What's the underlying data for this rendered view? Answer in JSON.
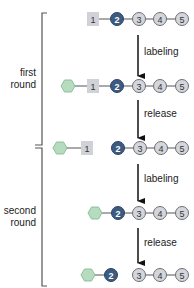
{
  "colors": {
    "dark_node": "#3d5a80",
    "light_node": "#d4d6dc",
    "node_border": "#6b6f78",
    "square": "#d0d2d8",
    "hexagon": "#b5dcbe",
    "hexagon_border": "#8fbf99",
    "line": "#555555",
    "arrow": "#111111"
  },
  "rounds": [
    {
      "label_line1": "first",
      "label_line2": "round"
    },
    {
      "label_line1": "second",
      "label_line2": "round"
    }
  ],
  "steps": [
    {
      "label": "labeling"
    },
    {
      "label": "release"
    },
    {
      "label": "labeling"
    },
    {
      "label": "release"
    }
  ],
  "rows": [
    {
      "hexagon": false,
      "square": "1",
      "circles": [
        "2",
        "3",
        "4",
        "5"
      ]
    },
    {
      "hexagon": true,
      "square": "1",
      "circles": [
        "2",
        "3",
        "4",
        "5"
      ]
    },
    {
      "hexagon": true,
      "square": "1",
      "circles": [
        "2",
        "3",
        "4",
        "5"
      ],
      "note": "square released; chain starts at 2"
    },
    {
      "hexagon": true,
      "square": null,
      "circles": [
        "2",
        "3",
        "4",
        "5"
      ]
    },
    {
      "hexagon": true,
      "square": null,
      "circles": [
        "2",
        "3",
        "4",
        "5"
      ],
      "note": "2 released; chain starts at 3"
    }
  ],
  "node_labels": {
    "r1_sq": "1",
    "r1_c2": "2",
    "r1_c3": "3",
    "r1_c4": "4",
    "r1_c5": "5",
    "r2_sq": "1",
    "r2_c2": "2",
    "r2_c3": "3",
    "r2_c4": "4",
    "r2_c5": "5",
    "r3_sq": "1",
    "r3_c2": "2",
    "r3_c3": "3",
    "r3_c4": "4",
    "r3_c5": "5",
    "r4_c2": "2",
    "r4_c3": "3",
    "r4_c4": "4",
    "r4_c5": "5",
    "r5_c2": "2",
    "r5_c3": "3",
    "r5_c4": "4",
    "r5_c5": "5"
  }
}
